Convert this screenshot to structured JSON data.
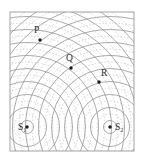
{
  "figure": {
    "background_color": "#ffffff",
    "frame": {
      "x": 10,
      "y": 12,
      "width": 124,
      "height": 139,
      "stroke_color": "#9a9a9a",
      "fill_color": "#ffffff"
    }
  },
  "chart_data": {
    "type": "scatter",
    "xlabel": "",
    "ylabel": "",
    "xlim": [
      10,
      134
    ],
    "ylim": [
      12,
      151
    ],
    "grid": false,
    "legend": "none",
    "annotations": [
      "Solid arcs represent wave crests",
      "Dotted arcs represent wave troughs"
    ],
    "sources": [
      {
        "name": "S1",
        "label": "S",
        "subscript": "1",
        "x": 27,
        "y": 127,
        "label_x": 18,
        "label_y": 130,
        "wavelength": 13,
        "num_wavefronts": 11
      },
      {
        "name": "S2",
        "label": "S",
        "subscript": "2",
        "x": 110,
        "y": 127,
        "label_x": 115,
        "label_y": 130,
        "wavelength": 13,
        "num_wavefronts": 11
      }
    ],
    "points": [
      {
        "name": "P",
        "label": "P",
        "x": 40,
        "y": 40,
        "label_x": 34,
        "label_y": 33
      },
      {
        "name": "Q",
        "label": "Q",
        "x": 71,
        "y": 68,
        "label_x": 66,
        "label_y": 61
      },
      {
        "name": "R",
        "label": "R",
        "x": 99,
        "y": 82,
        "label_x": 101,
        "label_y": 76
      }
    ],
    "styles": {
      "crest_stroke": "#8f8f8f",
      "crest_width": 0.75,
      "trough_stroke": "#bdbdbd",
      "trough_width": 0.7,
      "trough_dash": "1.4 1.9",
      "point_color": "#1a1a1a",
      "point_radius": 1.7
    }
  }
}
